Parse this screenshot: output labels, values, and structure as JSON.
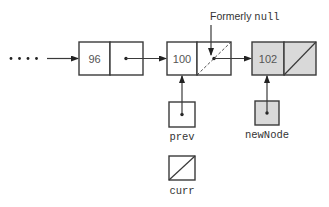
{
  "diagram": {
    "type": "linked-list-insertion",
    "ellipsis": "• • • •",
    "nodes": [
      {
        "id": "node-96",
        "value": "96",
        "shaded": false,
        "next": "pointer"
      },
      {
        "id": "node-100",
        "value": "100",
        "shaded": false,
        "next": "pointer (formerly null)"
      },
      {
        "id": "node-102",
        "value": "102",
        "shaded": true,
        "next": "null"
      }
    ],
    "annotation": {
      "prefix": "Formerly ",
      "code": "null"
    },
    "references": [
      {
        "name": "prev",
        "points_to": "node-100",
        "is_null": false,
        "shaded": false
      },
      {
        "name": "newNode",
        "points_to": "node-102",
        "is_null": false,
        "shaded": true
      },
      {
        "name": "curr",
        "points_to": null,
        "is_null": true,
        "shaded": false
      }
    ],
    "colors": {
      "stroke": "#3a3a3a",
      "shaded_fill": "#d9d9d9",
      "background": "#ffffff"
    }
  }
}
